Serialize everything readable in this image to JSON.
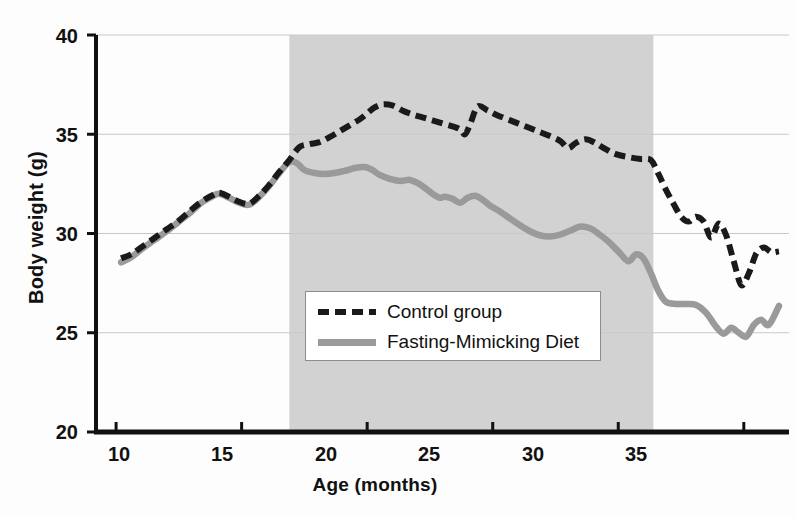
{
  "chart_data": {
    "type": "line",
    "title": "",
    "xlabel": "Age (months)",
    "ylabel": "Body weight (g)",
    "xlim": [
      9.2,
      36.8
    ],
    "ylim": [
      20,
      40
    ],
    "xticks": [
      10,
      15,
      20,
      25,
      30,
      35
    ],
    "yticks": [
      20,
      25,
      30,
      35,
      40
    ],
    "grid": "horizontal",
    "legend_position": "center",
    "shaded_region": {
      "label": "",
      "x_start": 16.9,
      "x_end": 31.4,
      "color": "#d2d2d2"
    },
    "series": [
      {
        "name": "Control group",
        "style": "dashed",
        "color": "#1a1a1a",
        "x": [
          10.2,
          10.6,
          11.0,
          11.5,
          12.0,
          12.5,
          13.0,
          13.4,
          13.8,
          14.1,
          14.5,
          14.9,
          15.3,
          15.7,
          16.1,
          16.5,
          16.9,
          17.3,
          17.7,
          18.1,
          18.5,
          18.9,
          19.3,
          19.7,
          20.0,
          20.3,
          20.6,
          21.0,
          21.4,
          21.8,
          22.2,
          22.6,
          23.0,
          23.4,
          23.7,
          23.9,
          24.1,
          24.4,
          24.8,
          25.2,
          25.7,
          26.2,
          26.7,
          27.2,
          27.7,
          28.0,
          28.3,
          28.7,
          29.1,
          29.5,
          29.9,
          30.4,
          30.9,
          31.3,
          31.6,
          31.9,
          32.2,
          32.5,
          32.8,
          33.1,
          33.4,
          33.7,
          34.0,
          34.3,
          34.6,
          34.9,
          35.2,
          35.5,
          35.8,
          36.1,
          36.4
        ],
        "y": [
          28.75,
          28.95,
          29.3,
          29.75,
          30.2,
          30.65,
          31.2,
          31.6,
          31.9,
          32.05,
          31.85,
          31.6,
          31.5,
          31.9,
          32.45,
          33.1,
          33.7,
          34.35,
          34.5,
          34.6,
          34.85,
          35.15,
          35.45,
          35.75,
          36.05,
          36.35,
          36.5,
          36.45,
          36.2,
          36.0,
          35.85,
          35.7,
          35.55,
          35.4,
          35.25,
          35.0,
          35.5,
          36.4,
          36.2,
          35.95,
          35.7,
          35.45,
          35.2,
          34.95,
          34.65,
          34.3,
          34.55,
          34.75,
          34.55,
          34.25,
          34.0,
          33.85,
          33.75,
          33.7,
          33.0,
          32.2,
          31.5,
          30.85,
          30.6,
          30.85,
          30.6,
          29.8,
          30.5,
          29.9,
          28.6,
          27.4,
          28.0,
          29.0,
          29.3,
          29.05,
          29.1
        ]
      },
      {
        "name": "Fasting-Mimicking Diet",
        "style": "solid",
        "color": "#9a9a9a",
        "x": [
          10.2,
          10.6,
          11.0,
          11.5,
          12.0,
          12.5,
          13.0,
          13.4,
          13.8,
          14.1,
          14.5,
          14.9,
          15.3,
          15.7,
          16.1,
          16.5,
          16.9,
          17.2,
          17.5,
          17.9,
          18.3,
          18.7,
          19.1,
          19.5,
          19.9,
          20.2,
          20.5,
          20.9,
          21.3,
          21.7,
          22.0,
          22.3,
          22.6,
          22.9,
          23.1,
          23.4,
          23.7,
          24.0,
          24.3,
          24.6,
          24.9,
          25.3,
          25.7,
          26.1,
          26.5,
          26.9,
          27.3,
          27.7,
          28.1,
          28.5,
          28.9,
          29.2,
          29.6,
          30.0,
          30.4,
          30.7,
          31.0,
          31.3,
          31.6,
          31.9,
          32.3,
          32.7,
          33.1,
          33.5,
          33.9,
          34.2,
          34.5,
          34.8,
          35.1,
          35.4,
          35.7,
          36.0,
          36.4
        ],
        "y": [
          28.55,
          28.8,
          29.2,
          29.65,
          30.1,
          30.6,
          31.1,
          31.55,
          31.85,
          32.0,
          31.8,
          31.55,
          31.45,
          31.85,
          32.4,
          33.05,
          33.6,
          33.55,
          33.2,
          33.05,
          33.0,
          33.05,
          33.15,
          33.3,
          33.35,
          33.2,
          32.95,
          32.75,
          32.65,
          32.7,
          32.55,
          32.3,
          32.0,
          31.8,
          31.85,
          31.75,
          31.55,
          31.8,
          31.9,
          31.7,
          31.4,
          31.1,
          30.75,
          30.4,
          30.1,
          29.9,
          29.85,
          29.95,
          30.15,
          30.35,
          30.25,
          30.0,
          29.6,
          29.1,
          28.6,
          28.95,
          28.75,
          28.0,
          27.1,
          26.55,
          26.45,
          26.45,
          26.4,
          26.0,
          25.3,
          24.95,
          25.25,
          25.0,
          24.8,
          25.4,
          25.65,
          25.4,
          26.35
        ]
      }
    ]
  },
  "legend": {
    "items": [
      {
        "label": "Control group",
        "style": "dashed"
      },
      {
        "label": "Fasting-Mimicking Diet",
        "style": "solid"
      }
    ]
  },
  "axes": {
    "y_label": "Body weight (g)",
    "x_label": "Age (months)",
    "y_ticks": [
      "40",
      "35",
      "30",
      "25",
      "20"
    ],
    "x_ticks": [
      "10",
      "15",
      "20",
      "25",
      "30",
      "35"
    ]
  }
}
